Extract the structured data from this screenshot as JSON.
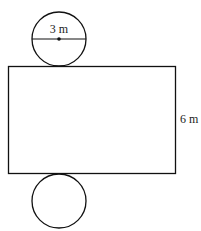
{
  "diagram": {
    "type": "cylinder-net",
    "top_circle": {
      "label": "3 m",
      "measure": "diameter"
    },
    "rectangle": {
      "side_label": "6 m",
      "measure": "height"
    },
    "bottom_circle": {
      "label": ""
    },
    "colors": {
      "stroke": "#111111",
      "background": "#ffffff"
    }
  }
}
